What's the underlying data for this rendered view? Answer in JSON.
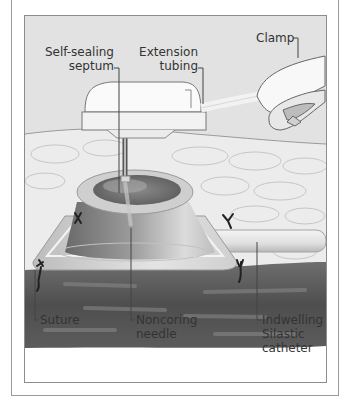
{
  "figure": {
    "type": "anatomical illustration"
  },
  "labels": {
    "septum_line1": "Self-sealing",
    "septum_line2": "septum",
    "tubing_line1": "Extension",
    "tubing_line2": "tubing",
    "clamp": "Clamp",
    "suture": "Suture",
    "needle_line1": "Noncoring",
    "needle_line2": "needle",
    "catheter_line1": "Indwelling",
    "catheter_line2": "Silastic",
    "catheter_line3": "catheter"
  },
  "colors": {
    "background": "#e2e2e2",
    "tissue_dark": "#5a5a5a",
    "skin": "#ededed",
    "port": "#9a9a9a",
    "border": "#8c8c8c"
  }
}
